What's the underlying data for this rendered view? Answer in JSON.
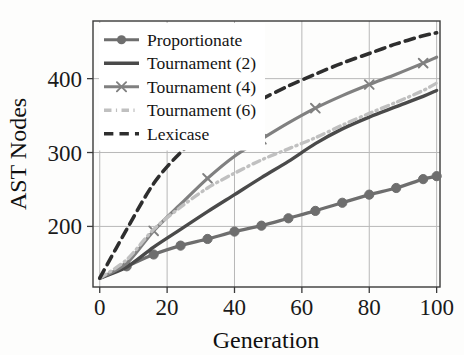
{
  "chart_data": {
    "type": "line",
    "title": "",
    "xlabel": "Generation",
    "ylabel": "AST Nodes",
    "xlim": [
      -2,
      101
    ],
    "ylim": [
      118,
      478
    ],
    "xticks": [
      0,
      20,
      40,
      60,
      80,
      100
    ],
    "yticks": [
      200,
      300,
      400
    ],
    "xtick_labels": [
      "0",
      "20",
      "40",
      "60",
      "80",
      "100"
    ],
    "ytick_labels": [
      "200",
      "300",
      "400"
    ],
    "grid": true,
    "legend_position": "upper left",
    "x": [
      0,
      8,
      16,
      24,
      32,
      40,
      48,
      56,
      64,
      72,
      80,
      88,
      96,
      100
    ],
    "series": [
      {
        "name": "Proportionate",
        "color": "#6e6e6e",
        "style": "solid-marker",
        "marker": "circle",
        "linewidth": 3.2,
        "values": [
          130,
          146,
          162,
          174,
          183,
          193,
          201,
          211,
          221,
          232,
          243,
          252,
          264,
          268
        ]
      },
      {
        "name": "Tournament (2)",
        "color": "#4a4a4a",
        "style": "solid",
        "marker": "none",
        "linewidth": 3.4,
        "values": [
          130,
          145,
          172,
          196,
          220,
          243,
          266,
          288,
          312,
          332,
          348,
          362,
          376,
          384
        ]
      },
      {
        "name": "Tournament (4)",
        "color": "#808080",
        "style": "solid-marker",
        "marker": "x",
        "linewidth": 3.2,
        "values": [
          130,
          150,
          194,
          230,
          265,
          295,
          318,
          340,
          360,
          377,
          392,
          406,
          421,
          429
        ]
      },
      {
        "name": "Tournament (6)",
        "color": "#c0c0c0",
        "style": "dashdot",
        "marker": "none",
        "linewidth": 3.4,
        "values": [
          130,
          155,
          196,
          226,
          252,
          272,
          290,
          305,
          320,
          337,
          353,
          368,
          384,
          394
        ]
      },
      {
        "name": "Lexicase",
        "color": "#2e2e2e",
        "style": "dashed",
        "marker": "none",
        "linewidth": 3.6,
        "values": [
          130,
          196,
          258,
          300,
          330,
          352,
          372,
          390,
          406,
          421,
          434,
          447,
          458,
          462
        ]
      }
    ]
  },
  "legend": {
    "entries": [
      {
        "label": "Proportionate"
      },
      {
        "label": "Tournament (2)"
      },
      {
        "label": "Tournament (4)"
      },
      {
        "label": "Tournament (6)"
      },
      {
        "label": "Lexicase"
      }
    ]
  },
  "geometry": {
    "plot_left": 93,
    "plot_right": 440,
    "plot_top": 21,
    "plot_bottom": 287
  }
}
